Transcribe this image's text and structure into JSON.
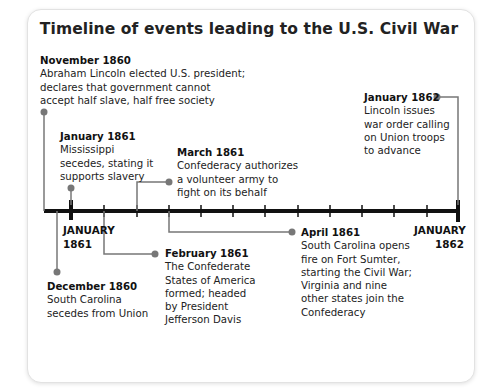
{
  "title": "Timeline of events leading to the U.S. Civil War",
  "axis": {
    "start_label_line1": "JANUARY",
    "start_label_line2": "1861",
    "end_label_line1": "JANUARY",
    "end_label_line2": "1862"
  },
  "events": [
    {
      "date": "November 1860",
      "lines": [
        "Abraham Lincoln elected U.S. president;",
        "declares that government cannot",
        "accept half slave, half free society"
      ]
    },
    {
      "date": "January 1861",
      "lines": [
        "Mississippi",
        "secedes, stating it",
        "supports slavery"
      ]
    },
    {
      "date": "March 1861",
      "lines": [
        "Confederacy authorizes",
        "a volunteer army to",
        "fight on its behalf"
      ]
    },
    {
      "date": "January 1862",
      "lines": [
        "Lincoln issues",
        "war order calling",
        "on Union troops",
        "to advance"
      ]
    },
    {
      "date": "December 1860",
      "lines": [
        "South Carolina",
        "secedes from Union"
      ]
    },
    {
      "date": "February 1861",
      "lines": [
        "The Confederate",
        "States of America",
        "formed; headed",
        "by President",
        "Jefferson Davis"
      ]
    },
    {
      "date": "April 1861",
      "lines": [
        "South Carolina opens",
        "fire on Fort Sumter,",
        "starting the Civil War;",
        "Virginia and nine",
        "other states join the",
        "Confederacy"
      ]
    }
  ],
  "colors": {
    "axis": "#111111",
    "connector": "#777777",
    "dot": "#777777"
  }
}
